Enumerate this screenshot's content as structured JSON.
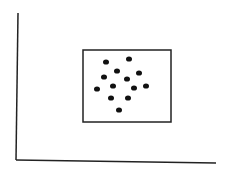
{
  "diagram": {
    "background": "#ffffff",
    "stroke_color": "#222222",
    "dot_color": "#111111",
    "axes": {
      "y_axis": {
        "x1": 18,
        "y1": 13,
        "x2": 16,
        "y2": 160
      },
      "x_axis": {
        "x1": 16,
        "y1": 160,
        "x2": 216,
        "y2": 163
      }
    },
    "box": {
      "x": 83,
      "y": 50,
      "width": 88,
      "height": 72
    },
    "dots": [
      {
        "cx": 106,
        "cy": 62
      },
      {
        "cx": 129,
        "cy": 59
      },
      {
        "cx": 117,
        "cy": 71
      },
      {
        "cx": 139,
        "cy": 73
      },
      {
        "cx": 104,
        "cy": 77
      },
      {
        "cx": 127,
        "cy": 79
      },
      {
        "cx": 113,
        "cy": 86
      },
      {
        "cx": 97,
        "cy": 89
      },
      {
        "cx": 134,
        "cy": 88
      },
      {
        "cx": 146,
        "cy": 86
      },
      {
        "cx": 111,
        "cy": 98
      },
      {
        "cx": 128,
        "cy": 98
      },
      {
        "cx": 119,
        "cy": 110
      }
    ]
  }
}
